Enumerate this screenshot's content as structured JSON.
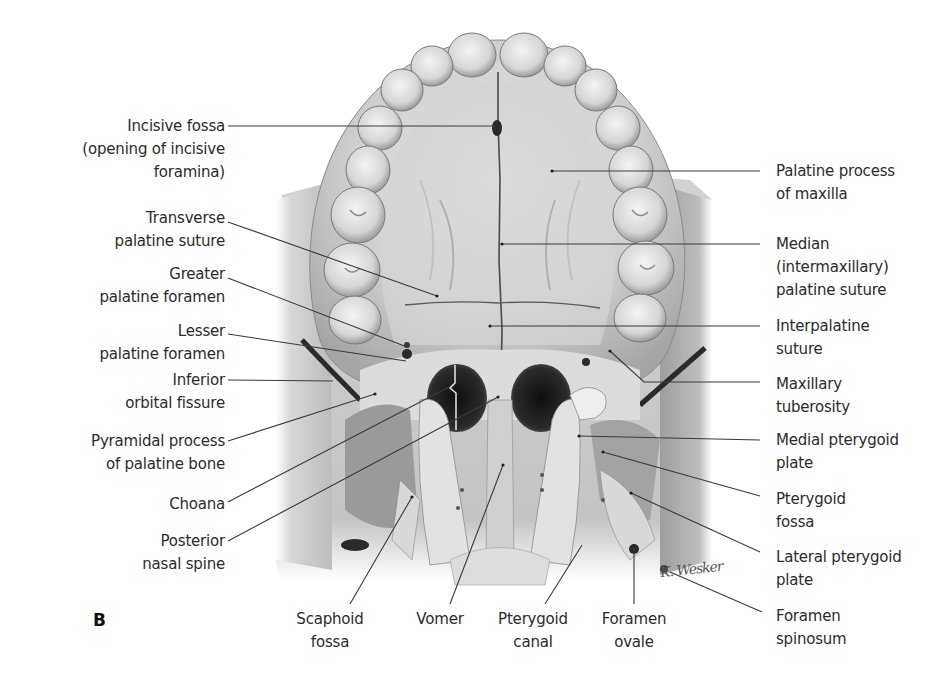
{
  "figure": {
    "panel_letter": "B",
    "view": "Inferior view of the hard palate and skull base",
    "signature": "K. Wesker",
    "colors": {
      "background": "#ffffff",
      "bone_light": "#e6e6e6",
      "bone_mid": "#bdbdbd",
      "bone_dark": "#7a7a7a",
      "cavity": "#1c1c1c",
      "leader_line": "#3a3a3a",
      "label_text": "#2b2b2b"
    }
  },
  "labels_left": [
    {
      "id": "incisive-fossa",
      "text": "Incisive fossa\n(opening of incisive\nforamina)"
    },
    {
      "id": "transverse-palatine-suture",
      "text": "Transverse\npalatine suture"
    },
    {
      "id": "greater-palatine-foramen",
      "text": "Greater\npalatine foramen"
    },
    {
      "id": "lesser-palatine-foramen",
      "text": "Lesser\npalatine foramen"
    },
    {
      "id": "inferior-orbital-fissure",
      "text": "Inferior\norbital fissure"
    },
    {
      "id": "pyramidal-process",
      "text": "Pyramidal process\nof palatine bone"
    },
    {
      "id": "choana",
      "text": "Choana"
    },
    {
      "id": "posterior-nasal-spine",
      "text": "Posterior\nnasal spine"
    }
  ],
  "labels_right": [
    {
      "id": "palatine-process-maxilla",
      "text": "Palatine process\nof maxilla"
    },
    {
      "id": "median-palatine-suture",
      "text": "Median\n(intermaxillary)\npalatine suture"
    },
    {
      "id": "interpalatine-suture",
      "text": "Interpalatine\nsuture"
    },
    {
      "id": "maxillary-tuberosity",
      "text": "Maxillary\ntuberosity"
    },
    {
      "id": "medial-pterygoid-plate",
      "text": "Medial pterygoid\nplate"
    },
    {
      "id": "pterygoid-fossa",
      "text": "Pterygoid\nfossa"
    },
    {
      "id": "lateral-pterygoid-plate",
      "text": "Lateral pterygoid\nplate"
    },
    {
      "id": "foramen-spinosum",
      "text": "Foramen\nspinosum"
    }
  ],
  "labels_bottom": [
    {
      "id": "scaphoid-fossa",
      "text": "Scaphoid\nfossa"
    },
    {
      "id": "vomer",
      "text": "Vomer"
    },
    {
      "id": "pterygoid-canal",
      "text": "Pterygoid\ncanal"
    },
    {
      "id": "foramen-ovale",
      "text": "Foramen\novale"
    }
  ]
}
